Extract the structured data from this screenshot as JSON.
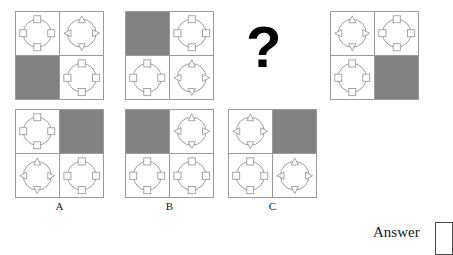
{
  "puzzle": {
    "type": "visual-analogy-matrix",
    "question_mark": "?",
    "answer_label": "Answer",
    "answer_value": "",
    "colors": {
      "shade": "#828282",
      "line": "#9a9a9a",
      "ink": "#000000"
    },
    "sequence": [
      {
        "name": "sequence-panel-1",
        "shaded_cell": "bottom-left",
        "cells": {
          "top_left": {
            "circle": true,
            "marker": "square"
          },
          "top_right": {
            "circle": true,
            "marker": "triangle"
          },
          "bottom_left": {
            "circle": false,
            "marker": "none"
          },
          "bottom_right": {
            "circle": true,
            "marker": "square"
          }
        }
      },
      {
        "name": "sequence-panel-2",
        "shaded_cell": "top-left",
        "cells": {
          "top_left": {
            "circle": false,
            "marker": "none"
          },
          "top_right": {
            "circle": true,
            "marker": "square"
          },
          "bottom_left": {
            "circle": true,
            "marker": "square"
          },
          "bottom_right": {
            "circle": true,
            "marker": "triangle"
          }
        }
      },
      {
        "name": "sequence-panel-3",
        "shaded_cell": "unknown",
        "cells": {}
      },
      {
        "name": "sequence-panel-4",
        "shaded_cell": "bottom-right",
        "cells": {
          "top_left": {
            "circle": true,
            "marker": "triangle"
          },
          "top_right": {
            "circle": true,
            "marker": "square"
          },
          "bottom_left": {
            "circle": true,
            "marker": "square"
          },
          "bottom_right": {
            "circle": false,
            "marker": "none"
          }
        }
      }
    ],
    "options": [
      {
        "label": "A",
        "name": "option-a",
        "shaded_cell": "top-right",
        "cells": {
          "top_left": {
            "circle": true,
            "marker": "square"
          },
          "top_right": {
            "circle": false,
            "marker": "none"
          },
          "bottom_left": {
            "circle": true,
            "marker": "triangle"
          },
          "bottom_right": {
            "circle": true,
            "marker": "square"
          }
        }
      },
      {
        "label": "B",
        "name": "option-b",
        "shaded_cell": "top-left",
        "cells": {
          "top_left": {
            "circle": false,
            "marker": "none"
          },
          "top_right": {
            "circle": true,
            "marker": "triangle"
          },
          "bottom_left": {
            "circle": true,
            "marker": "square"
          },
          "bottom_right": {
            "circle": true,
            "marker": "square"
          }
        }
      },
      {
        "label": "C",
        "name": "option-c",
        "shaded_cell": "top-right",
        "cells": {
          "top_left": {
            "circle": true,
            "marker": "triangle"
          },
          "top_right": {
            "circle": false,
            "marker": "none"
          },
          "bottom_left": {
            "circle": true,
            "marker": "square"
          },
          "bottom_right": {
            "circle": true,
            "marker": "triangle"
          }
        }
      }
    ],
    "geometry": {
      "sequence_panels": [
        {
          "x": 15,
          "y": 11,
          "w": 89,
          "h": 89
        },
        {
          "x": 125,
          "y": 11,
          "w": 89,
          "h": 89
        },
        {
          "x": 238,
          "y": 11,
          "w": 64,
          "h": 89
        },
        {
          "x": 330,
          "y": 11,
          "w": 89,
          "h": 89
        }
      ],
      "option_panels": [
        {
          "x": 15,
          "y": 109,
          "w": 89,
          "h": 89
        },
        {
          "x": 125,
          "y": 109,
          "w": 89,
          "h": 89
        },
        {
          "x": 228,
          "y": 109,
          "w": 89,
          "h": 89
        }
      ],
      "question_mark": {
        "x": 246,
        "y": 22,
        "size": 52
      },
      "option_labels_y": 200,
      "answer": {
        "label_x": 373,
        "label_y": 232,
        "box_x": 435,
        "box_y": 224,
        "box_w": 18,
        "box_h": 31
      }
    }
  }
}
